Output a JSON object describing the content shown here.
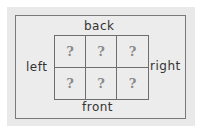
{
  "diagram": {
    "labels": {
      "back": "back",
      "front": "front",
      "left": "left",
      "right": "right"
    },
    "grid": {
      "rows": 2,
      "cols": 3,
      "cells": [
        "?",
        "?",
        "?",
        "?",
        "?",
        "?"
      ]
    }
  }
}
